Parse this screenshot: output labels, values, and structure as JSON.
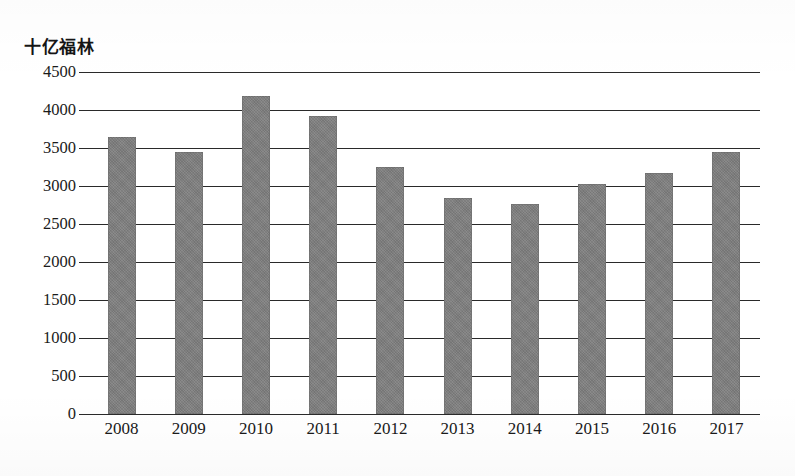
{
  "chart_data": {
    "type": "bar",
    "title": "",
    "ylabel": "十亿福林",
    "xlabel": "",
    "categories": [
      "2008",
      "2009",
      "2010",
      "2011",
      "2012",
      "2013",
      "2014",
      "2015",
      "2016",
      "2017"
    ],
    "values": [
      3650,
      3450,
      4180,
      3920,
      3250,
      2840,
      2760,
      3030,
      3170,
      3450
    ],
    "series": [
      {
        "name": "十亿福林",
        "values": [
          3650,
          3450,
          4180,
          3920,
          3250,
          2840,
          2760,
          3030,
          3170,
          3450
        ]
      }
    ],
    "ylim": [
      0,
      4500
    ],
    "ytick_labels": [
      "0",
      "500",
      "1000",
      "1500",
      "2000",
      "2500",
      "3000",
      "3500",
      "4000",
      "4500"
    ],
    "ytick_values": [
      0,
      500,
      1000,
      1500,
      2000,
      2500,
      3000,
      3500,
      4000,
      4500
    ],
    "ytick_step": 500,
    "grid": true,
    "grid_axis": "y",
    "legend": false,
    "legend_position": "none",
    "bar_color": "#7e7e7e",
    "gridline_color": "#2a2a2a",
    "background_color": "#ffffff"
  }
}
